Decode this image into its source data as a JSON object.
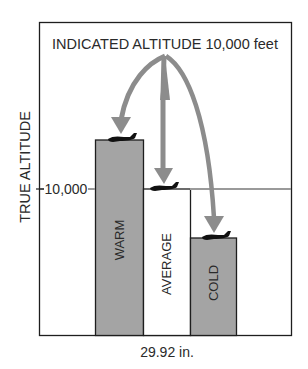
{
  "title": "INDICATED ALTITUDE 10,000 feet",
  "y_axis_label": "TRUE ALTITUDE",
  "reference_label": "10,000",
  "x_axis_label": "29.92 in.",
  "bars": [
    {
      "label": "WARM",
      "relative_height": "above 10,000",
      "fill": "#a4a4a4"
    },
    {
      "label": "AVERAGE",
      "relative_height": "at 10,000",
      "fill": "#ffffff"
    },
    {
      "label": "COLD",
      "relative_height": "below 10,000",
      "fill": "#a4a4a4"
    }
  ],
  "colors": {
    "bar_gray": "#a4a4a4",
    "arrow_gray": "#8c8c8c",
    "reference_line": "#9a9a9a",
    "outline": "#1e1e1e",
    "aircraft": "#111111"
  },
  "icons": [
    "aircraft-icon",
    "arrow-icon"
  ]
}
